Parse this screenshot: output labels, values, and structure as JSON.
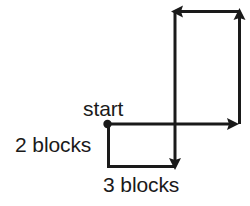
{
  "figure": {
    "kind": "route-path-diagram",
    "background_color": "#ffffff",
    "stroke_color": "#1a1a1a",
    "stroke_width": 3,
    "width": 250,
    "height": 206
  },
  "labels": {
    "start": "start",
    "vertical_distance": "2 blocks",
    "horizontal_distance": "3 blocks"
  },
  "path": {
    "start_point": {
      "x": 107,
      "y": 124
    },
    "segments": [
      {
        "name": "down-two-blocks",
        "direction": "down",
        "length_blocks": 2,
        "from": {
          "x": 107,
          "y": 124
        },
        "to": {
          "x": 107,
          "y": 167
        },
        "arrow": "none"
      },
      {
        "name": "right-three-blocks",
        "direction": "right",
        "length_blocks": 3,
        "from": {
          "x": 107,
          "y": 167
        },
        "to": {
          "x": 175,
          "y": 167
        },
        "arrow": "none"
      },
      {
        "name": "down-arrow-terminus",
        "direction": "down",
        "from": {
          "x": 175,
          "y": 150
        },
        "to": {
          "x": 175,
          "y": 169
        },
        "arrow": "end"
      },
      {
        "name": "up-long-leg",
        "direction": "up",
        "from": {
          "x": 175,
          "y": 169
        },
        "to": {
          "x": 175,
          "y": 11
        },
        "arrow": "none"
      },
      {
        "name": "top-left-arrow",
        "direction": "left",
        "from": {
          "x": 240,
          "y": 11
        },
        "to": {
          "x": 172,
          "y": 11
        },
        "arrow": "end"
      },
      {
        "name": "right-vertical-up-arrow",
        "direction": "up",
        "from": {
          "x": 240,
          "y": 124
        },
        "to": {
          "x": 240,
          "y": 10
        },
        "arrow": "end"
      },
      {
        "name": "right-horizontal-arrow",
        "direction": "right",
        "from": {
          "x": 107,
          "y": 124
        },
        "to": {
          "x": 239,
          "y": 124
        },
        "arrow": "end"
      }
    ],
    "dot_radius": 4
  }
}
